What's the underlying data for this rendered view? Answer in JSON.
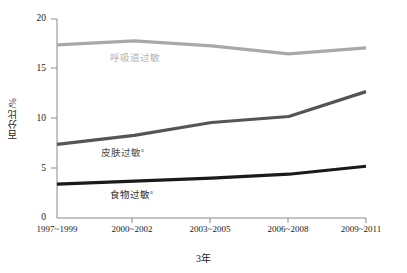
{
  "chart_data": {
    "type": "line",
    "title": "",
    "xlabel": "3年",
    "ylabel": "百分比/%",
    "categories": [
      "1997~1999",
      "2000~2002",
      "2003~2005",
      "2006~2008",
      "2009~2011"
    ],
    "ylim": [
      0,
      20
    ],
    "yticks": [
      0,
      5,
      10,
      15,
      20
    ],
    "grid": false,
    "legend_position": "inline",
    "series": [
      {
        "name": "呼吸道过敏",
        "label": "呼吸道过敏",
        "marker": "",
        "color": "#a8a8a8",
        "values": [
          17.4,
          17.8,
          17.3,
          16.5,
          17.1
        ]
      },
      {
        "name": "皮肤过敏",
        "label": "皮肤过敏",
        "marker": "a",
        "color": "#555555",
        "values": [
          7.4,
          8.3,
          9.6,
          10.2,
          12.7
        ]
      },
      {
        "name": "食物过敏",
        "label": "食物过敏",
        "marker": "a",
        "color": "#1a1a1a",
        "values": [
          3.4,
          3.7,
          4.0,
          4.4,
          5.2
        ]
      }
    ]
  },
  "axis": {
    "y_tick_labels": [
      "20",
      "15",
      "10",
      "5",
      "0"
    ],
    "x_tick_labels": [
      "1997~1999",
      "2000~2002",
      "2003~2005",
      "2006~2008",
      "2009~2011"
    ],
    "y_title": "百分比/%",
    "x_title": "3年"
  },
  "colors": {
    "respiratory": "#a8a8a8",
    "skin": "#555555",
    "food": "#1a1a1a",
    "axis": "#8a8a8a",
    "text": "#1a1a1a"
  }
}
